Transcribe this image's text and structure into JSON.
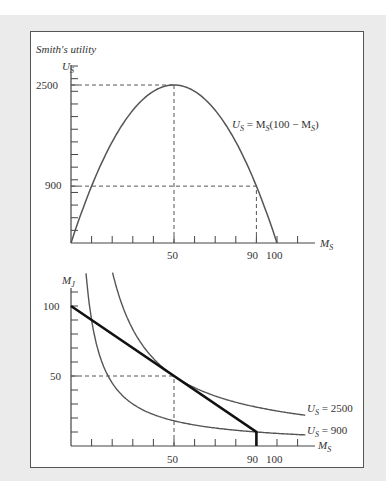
{
  "chart_data": [
    {
      "type": "line",
      "title": "Smith's utility",
      "ylabel": "U_S",
      "xlabel": "M_S",
      "function": "U_S = M_S(100 - M_S)",
      "curve_label": "U_S = M_S(100 − M_S)",
      "x": [
        0,
        10,
        20,
        30,
        40,
        50,
        60,
        70,
        80,
        90,
        100
      ],
      "series": [
        {
          "name": "U_S",
          "values": [
            0,
            900,
            1600,
            2100,
            2400,
            2500,
            2400,
            2100,
            1600,
            900,
            0
          ]
        }
      ],
      "xticks": [
        50,
        90,
        100
      ],
      "yticks": [
        900,
        2500
      ],
      "xlim": [
        0,
        120
      ],
      "ylim": [
        0,
        2850
      ],
      "reference_lines": [
        {
          "type": "dashed",
          "from": [
            0,
            2500
          ],
          "to": [
            50,
            2500
          ]
        },
        {
          "type": "dashed",
          "from": [
            50,
            0
          ],
          "to": [
            50,
            2500
          ]
        },
        {
          "type": "dashed",
          "from": [
            0,
            900
          ],
          "to": [
            90,
            900
          ]
        },
        {
          "type": "dashed",
          "from": [
            90,
            0
          ],
          "to": [
            90,
            900
          ]
        }
      ],
      "grid": false
    },
    {
      "type": "line",
      "ylabel": "M_J",
      "xlabel": "M_S",
      "xticks": [
        50,
        90,
        100
      ],
      "yticks": [
        50,
        100
      ],
      "xlim": [
        0,
        120
      ],
      "ylim": [
        0,
        113
      ],
      "series": [
        {
          "name": "Budget line",
          "style": "bold",
          "x": [
            0,
            90,
            90
          ],
          "values": [
            100,
            10,
            0
          ]
        },
        {
          "name": "U_S = 900",
          "equation": "M_J = 900 / M_S",
          "label": "U_S = 900"
        },
        {
          "name": "U_S = 2500",
          "equation": "M_J = 2500 / M_S",
          "label": "U_S = 2500"
        }
      ],
      "reference_lines": [
        {
          "type": "dashed",
          "from": [
            0,
            50
          ],
          "to": [
            50,
            50
          ]
        },
        {
          "type": "dashed",
          "from": [
            50,
            0
          ],
          "to": [
            50,
            50
          ]
        }
      ],
      "grid": false
    }
  ],
  "labels": {
    "top_title": "Smith's utility",
    "top_y_axis": "U",
    "top_y_sub": "S",
    "top_x_axis": "M",
    "top_x_sub": "S",
    "top_y_2500": "2500",
    "top_y_900": "900",
    "top_x_50": "50",
    "top_x_90": "90",
    "top_x_100": "100",
    "bot_y_axis": "M",
    "bot_y_sub": "J",
    "bot_x_axis": "M",
    "bot_x_sub": "S",
    "bot_y_100": "100",
    "bot_y_50": "50",
    "bot_x_50": "50",
    "bot_x_90": "90",
    "bot_x_100": "100",
    "eq_U": "U",
    "eq_sub": "S",
    "eq_mid": " = M",
    "eq_sub2": "S",
    "eq_tail": "(100 − M",
    "eq_sub3": "S",
    "eq_end": ")",
    "ic2500_pre": "U",
    "ic2500_sub": "S",
    "ic2500_val": " = 2500",
    "ic900_pre": "U",
    "ic900_sub": "S",
    "ic900_val": " = 900"
  },
  "colors": {
    "curve": "#555555",
    "budget": "#111111",
    "axis": "#444444",
    "dash": "#555555"
  }
}
